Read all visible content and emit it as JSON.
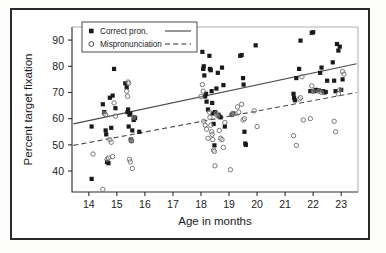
{
  "chart_data": {
    "type": "scatter",
    "title": "",
    "xlabel": "Age in months",
    "ylabel": "Percent target fixation",
    "xlim": [
      13.4,
      23.6
    ],
    "ylim": [
      32,
      95
    ],
    "xticks": [
      14,
      15,
      16,
      17,
      18,
      19,
      20,
      21,
      22,
      23
    ],
    "yticks": [
      40,
      50,
      60,
      70,
      80,
      90
    ],
    "grid": false,
    "legend_position": "top-left",
    "legend": [
      {
        "label": "Correct pron.",
        "marker": "filled-square",
        "line": "solid"
      },
      {
        "label": "Mispronunciation",
        "marker": "open-circle",
        "line": "dashed"
      }
    ],
    "series": [
      {
        "name": "Correct pron.",
        "marker": "filled-square",
        "color": "#1a1a1a",
        "points": [
          [
            14.1,
            57.0
          ],
          [
            14.1,
            37.0
          ],
          [
            14.5,
            65.5
          ],
          [
            14.55,
            62.5
          ],
          [
            14.6,
            55.5
          ],
          [
            14.62,
            54.0
          ],
          [
            14.65,
            43.5
          ],
          [
            14.7,
            43.0
          ],
          [
            14.75,
            68.0
          ],
          [
            14.8,
            56.5
          ],
          [
            14.85,
            68.8
          ],
          [
            14.9,
            79.0
          ],
          [
            14.95,
            64.0
          ],
          [
            15.3,
            73.5
          ],
          [
            15.35,
            72.0
          ],
          [
            15.38,
            62.5
          ],
          [
            15.4,
            63.5
          ],
          [
            15.42,
            57.0
          ],
          [
            15.45,
            61.5
          ],
          [
            15.48,
            62.0
          ],
          [
            15.5,
            52.0
          ],
          [
            15.52,
            51.5
          ],
          [
            15.55,
            55.5
          ],
          [
            15.6,
            59.5
          ],
          [
            15.62,
            60.5
          ],
          [
            15.65,
            60.2
          ],
          [
            15.8,
            55.0
          ],
          [
            18.05,
            85.5
          ],
          [
            18.08,
            79.0
          ],
          [
            18.1,
            80.0
          ],
          [
            18.12,
            76.5
          ],
          [
            18.15,
            68.5
          ],
          [
            18.18,
            69.5
          ],
          [
            18.2,
            66.5
          ],
          [
            18.25,
            63.5
          ],
          [
            18.3,
            84.0
          ],
          [
            18.32,
            79.0
          ],
          [
            18.35,
            78.5
          ],
          [
            18.38,
            70.5
          ],
          [
            18.4,
            66.0
          ],
          [
            18.42,
            62.0
          ],
          [
            18.45,
            58.0
          ],
          [
            18.48,
            49.8
          ],
          [
            18.5,
            62.5
          ],
          [
            18.55,
            71.5
          ],
          [
            18.6,
            77.5
          ],
          [
            18.62,
            61.5
          ],
          [
            18.65,
            61.0
          ],
          [
            18.7,
            60.5
          ],
          [
            18.75,
            79.5
          ],
          [
            18.8,
            72.8
          ],
          [
            18.85,
            57.0
          ],
          [
            19.1,
            61.5
          ],
          [
            19.15,
            62.0
          ],
          [
            19.4,
            84.0
          ],
          [
            19.45,
            84.3
          ],
          [
            19.5,
            75.5
          ],
          [
            19.52,
            73.0
          ],
          [
            19.55,
            55.0
          ],
          [
            19.58,
            50.5
          ],
          [
            19.6,
            50.0
          ],
          [
            19.95,
            88.0
          ],
          [
            21.3,
            69.5
          ],
          [
            21.32,
            68.0
          ],
          [
            21.35,
            67.0
          ],
          [
            21.4,
            75.5
          ],
          [
            21.5,
            79.0
          ],
          [
            21.55,
            89.8
          ],
          [
            21.9,
            70.5
          ],
          [
            21.95,
            92.8
          ],
          [
            22.0,
            93.0
          ],
          [
            22.05,
            70.5
          ],
          [
            22.1,
            71.0
          ],
          [
            22.2,
            70.8
          ],
          [
            22.25,
            77.5
          ],
          [
            22.3,
            79.5
          ],
          [
            22.35,
            70.5
          ],
          [
            22.4,
            70.0
          ],
          [
            22.45,
            70.2
          ],
          [
            22.5,
            74.5
          ],
          [
            22.7,
            81.5
          ],
          [
            22.75,
            74.5
          ],
          [
            22.8,
            70.5
          ],
          [
            22.85,
            88.5
          ],
          [
            22.9,
            86.0
          ],
          [
            22.95,
            87.5
          ],
          [
            23.0,
            71.0
          ],
          [
            23.05,
            75.0
          ]
        ]
      },
      {
        "name": "Mispronunciation",
        "marker": "open-circle",
        "color": "#6b6b6b",
        "points": [
          [
            14.15,
            46.5
          ],
          [
            14.5,
            33.0
          ],
          [
            14.55,
            62.0
          ],
          [
            14.6,
            61.5
          ],
          [
            14.65,
            44.5
          ],
          [
            14.7,
            45.0
          ],
          [
            14.75,
            52.0
          ],
          [
            14.8,
            51.0
          ],
          [
            14.85,
            45.5
          ],
          [
            14.9,
            66.0
          ],
          [
            14.95,
            61.0
          ],
          [
            15.35,
            70.5
          ],
          [
            15.38,
            68.5
          ],
          [
            15.4,
            74.0
          ],
          [
            15.42,
            73.5
          ],
          [
            15.45,
            44.5
          ],
          [
            15.48,
            43.5
          ],
          [
            15.5,
            52.0
          ],
          [
            15.52,
            51.5
          ],
          [
            15.55,
            41.0
          ],
          [
            15.6,
            60.5
          ],
          [
            18.0,
            68.5
          ],
          [
            18.05,
            73.0
          ],
          [
            18.08,
            70.5
          ],
          [
            18.1,
            59.0
          ],
          [
            18.15,
            57.5
          ],
          [
            18.2,
            56.0
          ],
          [
            18.25,
            52.5
          ],
          [
            18.3,
            62.5
          ],
          [
            18.32,
            60.5
          ],
          [
            18.35,
            57.5
          ],
          [
            18.38,
            55.0
          ],
          [
            18.4,
            54.0
          ],
          [
            18.42,
            52.0
          ],
          [
            18.45,
            48.0
          ],
          [
            18.48,
            47.5
          ],
          [
            18.5,
            42.0
          ],
          [
            18.55,
            62.0
          ],
          [
            18.6,
            61.0
          ],
          [
            18.65,
            55.5
          ],
          [
            18.7,
            52.5
          ],
          [
            18.75,
            52.0
          ],
          [
            18.8,
            49.0
          ],
          [
            18.85,
            58.5
          ],
          [
            19.05,
            40.5
          ],
          [
            19.1,
            61.5
          ],
          [
            19.15,
            62.0
          ],
          [
            19.3,
            64.5
          ],
          [
            19.35,
            62.5
          ],
          [
            19.45,
            65.5
          ],
          [
            19.5,
            59.5
          ],
          [
            19.55,
            60.0
          ],
          [
            19.9,
            63.0
          ],
          [
            20.0,
            57.0
          ],
          [
            21.3,
            53.5
          ],
          [
            21.4,
            49.8
          ],
          [
            21.5,
            67.5
          ],
          [
            21.55,
            68.0
          ],
          [
            21.6,
            76.0
          ],
          [
            21.65,
            59.5
          ],
          [
            21.9,
            60.0
          ],
          [
            21.95,
            72.5
          ],
          [
            22.0,
            70.5
          ],
          [
            22.2,
            70.5
          ],
          [
            22.3,
            70.0
          ],
          [
            22.75,
            59.0
          ],
          [
            22.8,
            55.0
          ],
          [
            22.9,
            69.5
          ],
          [
            22.95,
            71.0
          ],
          [
            23.05,
            78.0
          ],
          [
            23.1,
            77.0
          ]
        ]
      }
    ],
    "fit_lines": [
      {
        "name": "Correct pron. fit",
        "style": "solid",
        "x0": 13.45,
        "y0": 58.0,
        "x1": 23.55,
        "y1": 81.0
      },
      {
        "name": "Mispronunciation fit",
        "style": "dashed",
        "x0": 13.45,
        "y0": 49.8,
        "x1": 23.55,
        "y1": 70.0
      }
    ]
  }
}
